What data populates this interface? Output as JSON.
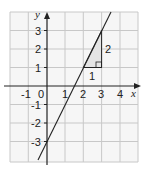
{
  "diagram": {
    "type": "coordinate-graph",
    "grid": {
      "xmin": -2,
      "xmax": 5,
      "ymin": -4,
      "ymax": 4
    },
    "axes": {
      "xlabel": "x",
      "ylabel": "y",
      "origin_label": "0"
    },
    "x_ticks": [
      "-1",
      "1",
      "2",
      "3",
      "4"
    ],
    "y_ticks": [
      "3",
      "2",
      "1",
      "-1",
      "-2",
      "-3"
    ],
    "line": {
      "equation": "y = 2x - 3",
      "slope": 2,
      "intercept": -3
    },
    "gradient_triangle": {
      "run_label": "1",
      "rise_label": "2",
      "from": [
        2,
        1
      ],
      "to": [
        3,
        3
      ]
    },
    "colors": {
      "grid": "#c8c8c8",
      "axis": "#222222",
      "line": "#222222",
      "triangle_fill": "#e6e6e6",
      "background": "#f4f4f4"
    }
  }
}
